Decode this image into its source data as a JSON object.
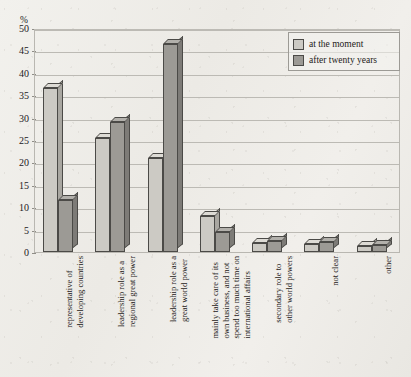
{
  "chart_data": {
    "type": "bar",
    "title": "",
    "xlabel": "",
    "ylabel": "%",
    "ylim": [
      0,
      50
    ],
    "ytick_step": 5,
    "yticks": [
      "0",
      "5",
      "10",
      "15",
      "20",
      "25",
      "30",
      "35",
      "40",
      "45",
      "50"
    ],
    "grid": true,
    "legend_position": "top-right",
    "categories": [
      "representative of\ndeveloping countries",
      "leadership role as a\nregional great power",
      "leadership role as a\ngreat world power",
      "mainly take care of its\nown business, and not\nspend too much time on\ninternational affairs",
      "secondary role to\nother world powers",
      "not clear",
      "other"
    ],
    "series": [
      {
        "name": "at the moment",
        "color": "#cccac4",
        "values": [
          36.5,
          25.5,
          21.0,
          8.0,
          2.0,
          1.8,
          1.4
        ]
      },
      {
        "name": "after twenty years",
        "color": "#9c9a95",
        "values": [
          11.5,
          29.0,
          46.5,
          4.5,
          2.4,
          2.2,
          1.5
        ]
      }
    ]
  },
  "axis": {
    "unit_label": "%"
  },
  "legend": {
    "items": [
      {
        "label": "at the moment",
        "swatch": "light"
      },
      {
        "label": "after twenty years",
        "swatch": "dark"
      }
    ]
  }
}
